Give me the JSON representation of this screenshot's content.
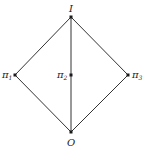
{
  "diagram": {
    "type": "hasse-diagram",
    "colors": {
      "edge": "#333333",
      "node": "#1a1a1a",
      "label": "#222222",
      "background": "#ffffff"
    },
    "nodes": [
      {
        "id": "top",
        "label": "I",
        "sub": "",
        "x": 71,
        "y": 17
      },
      {
        "id": "pi1",
        "label": "π",
        "sub": "1",
        "x": 15,
        "y": 75
      },
      {
        "id": "pi2",
        "label": "π",
        "sub": "2",
        "x": 71,
        "y": 75
      },
      {
        "id": "pi3",
        "label": "π",
        "sub": "3",
        "x": 128,
        "y": 75
      },
      {
        "id": "bottom",
        "label": "O",
        "sub": "",
        "x": 71,
        "y": 132
      }
    ],
    "edges": [
      [
        "top",
        "pi1"
      ],
      [
        "top",
        "pi2"
      ],
      [
        "top",
        "pi3"
      ],
      [
        "pi1",
        "bottom"
      ],
      [
        "pi2",
        "bottom"
      ],
      [
        "pi3",
        "bottom"
      ]
    ]
  }
}
